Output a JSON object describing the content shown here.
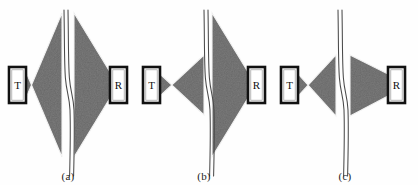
{
  "figure": {
    "background_color": "#fefefe",
    "beam_fill_color": "#3a3a3a",
    "beam_edge_color": "#e8e8e8",
    "seam_line_color": "#555555",
    "probe_border_color": "#111111",
    "probe_fill_color": "#ffffff",
    "label_color": "#1a1a1a"
  },
  "panels": [
    {
      "id": "a",
      "caption": "(a)",
      "transmitter": {
        "label": "T",
        "name": "transmitter-probe"
      },
      "receiver": {
        "label": "R",
        "name": "receiver-probe"
      },
      "seam": {
        "name": "weld-seam-line",
        "shape": "double-wavy-vertical"
      },
      "beams": [
        {
          "name": "transmit-beam",
          "size": "large",
          "apex": "left",
          "spread": "wide"
        },
        {
          "name": "receive-beam",
          "size": "large",
          "apex": "right",
          "spread": "wide"
        }
      ]
    },
    {
      "id": "b",
      "caption": "(b)",
      "transmitter": {
        "label": "T",
        "name": "transmitter-probe"
      },
      "receiver": {
        "label": "R",
        "name": "receiver-probe"
      },
      "seam": {
        "name": "weld-seam-line",
        "shape": "double-wavy-vertical"
      },
      "beams": [
        {
          "name": "transmit-beam",
          "size": "small",
          "apex": "left",
          "spread": "narrow"
        },
        {
          "name": "receive-beam",
          "size": "large",
          "apex": "right",
          "spread": "wide"
        }
      ]
    },
    {
      "id": "c",
      "caption": "(c)",
      "transmitter": {
        "label": "T",
        "name": "transmitter-probe"
      },
      "receiver": {
        "label": "R",
        "name": "receiver-probe"
      },
      "seam": {
        "name": "weld-seam-line",
        "shape": "double-wavy-vertical"
      },
      "beams": [
        {
          "name": "transmit-beam",
          "size": "small",
          "apex": "left",
          "spread": "narrow"
        },
        {
          "name": "receive-beam",
          "size": "small",
          "apex": "right",
          "spread": "narrow"
        }
      ]
    }
  ]
}
